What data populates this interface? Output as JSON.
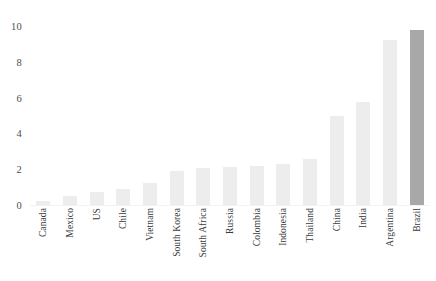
{
  "chart_data": {
    "type": "bar",
    "title": "",
    "subtitle": "",
    "xlabel": "",
    "ylabel": "",
    "ylim": [
      0,
      10
    ],
    "yticks": [
      0,
      2,
      4,
      6,
      8,
      10
    ],
    "ytick_labels": [
      "0",
      "2",
      "4",
      "6",
      "8",
      "10"
    ],
    "grid": false,
    "legend": null,
    "categories": [
      "Canada",
      "Mexico",
      "US",
      "Chile",
      "Vietnam",
      "South Korea",
      "South Africa",
      "Russia",
      "Colombia",
      "Indonesia",
      "Thailand",
      "China",
      "India",
      "Argentina",
      "Brazil"
    ],
    "values": [
      0.2,
      0.5,
      0.7,
      0.9,
      1.25,
      1.9,
      2.05,
      2.1,
      2.2,
      2.3,
      2.55,
      5.0,
      5.75,
      9.2,
      9.8
    ],
    "highlighted_category": "Brazil",
    "colors": {
      "bar": "#ededed",
      "bar_highlight": "#a8a8a8",
      "axis_text": "#4d4d4d",
      "label_text": "#3a3a3a",
      "background": "#ffffff"
    }
  }
}
